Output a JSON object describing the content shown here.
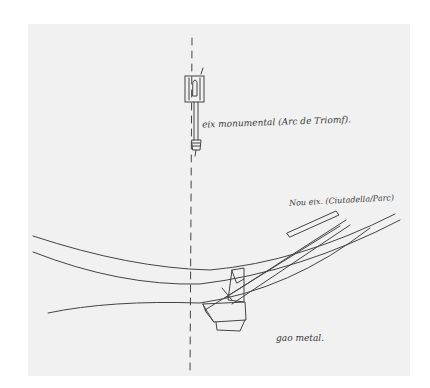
{
  "sketch": {
    "annotations": {
      "monumental_axis": "eix monumental (Arc de Triomf).",
      "new_axis": "Nou eix. (Ciutadella/Parc)",
      "object_label": "gao metal."
    },
    "colors": {
      "paper": "#f1f1f1",
      "ink": "#3a3a3a",
      "background": "#ffffff"
    }
  }
}
